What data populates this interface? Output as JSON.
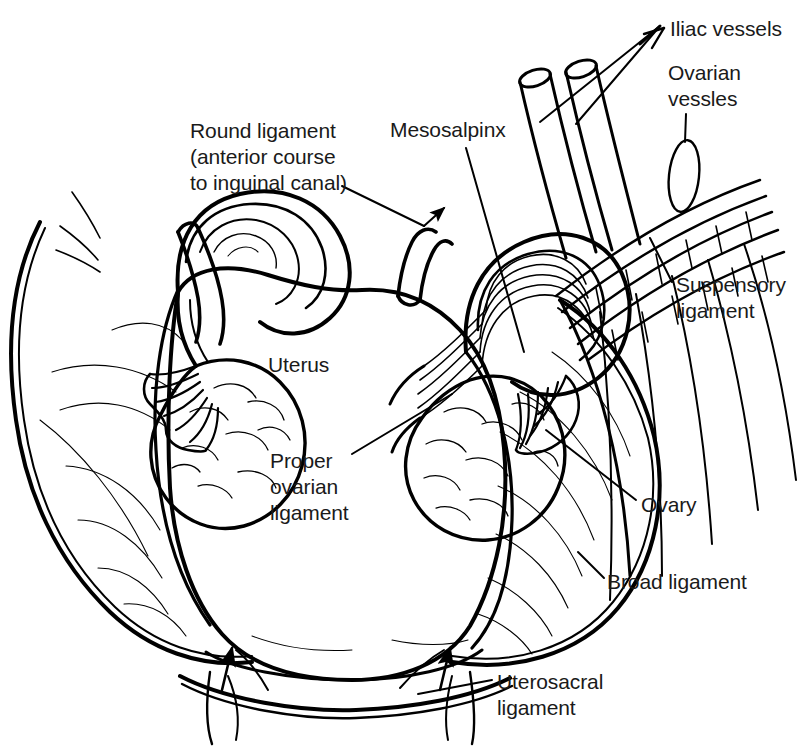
{
  "figure": {
    "type": "line-drawing",
    "view": "posterior view of uterus with bilateral fallopian tubes, ovaries and broad ligaments",
    "background_color": "#ffffff",
    "line_color": "#000000"
  },
  "labels": {
    "iliac_vessels": "Iliac vessels",
    "ovarian_vessels": "Ovarian\nvessles",
    "round_ligament": "Round ligament\n(anterior course\nto inguinal canal)",
    "mesosalpinx": "Mesosalpinx",
    "suspensory_ligament": "Suspensory\nligament",
    "uterus": "Uterus",
    "proper_ovarian_ligament": "Proper\novarian\nligament",
    "ovary": "Ovary",
    "broad_ligament": "Broad ligament",
    "uterosacral_ligament": "Uterosacral\nligament"
  },
  "leader_lines": [
    {
      "label": "iliac_vessels",
      "style": "two-branch-arrow",
      "target": "cut ends of iliac vessels"
    },
    {
      "label": "ovarian_vessels",
      "style": "line-to-ellipse-marker",
      "target": "ovarian vessel bundle"
    },
    {
      "label": "round_ligament",
      "style": "line-with-arrowhead",
      "target": "right round ligament stump"
    },
    {
      "label": "mesosalpinx",
      "style": "plain-line",
      "target": "right mesosalpinx fold"
    },
    {
      "label": "suspensory_ligament",
      "style": "plain-line",
      "target": "suspensory ligament fibers"
    },
    {
      "label": "uterus",
      "style": "none",
      "target": "uterine fundus"
    },
    {
      "label": "proper_ovarian_ligament",
      "style": "plain-line",
      "target": "right proper ovarian ligament"
    },
    {
      "label": "ovary",
      "style": "plain-line",
      "target": "right ovary"
    },
    {
      "label": "broad_ligament",
      "style": "plain-line",
      "target": "right broad ligament"
    },
    {
      "label": "uterosacral_ligament",
      "style": "plain-line",
      "target": "right uterosacral ligament"
    }
  ],
  "structures": [
    "uterine fundus and body",
    "cervix",
    "left fallopian tube with ampulla and fimbriae",
    "right fallopian tube with ampulla and fimbriae",
    "left ovary",
    "right ovary",
    "left broad ligament",
    "right broad ligament",
    "left round ligament stump",
    "right round ligament stump",
    "mesosalpinx",
    "suspensory ligament of ovary",
    "ovarian vessels",
    "iliac vessels (cut)",
    "left uterosacral ligament",
    "right uterosacral ligament"
  ]
}
